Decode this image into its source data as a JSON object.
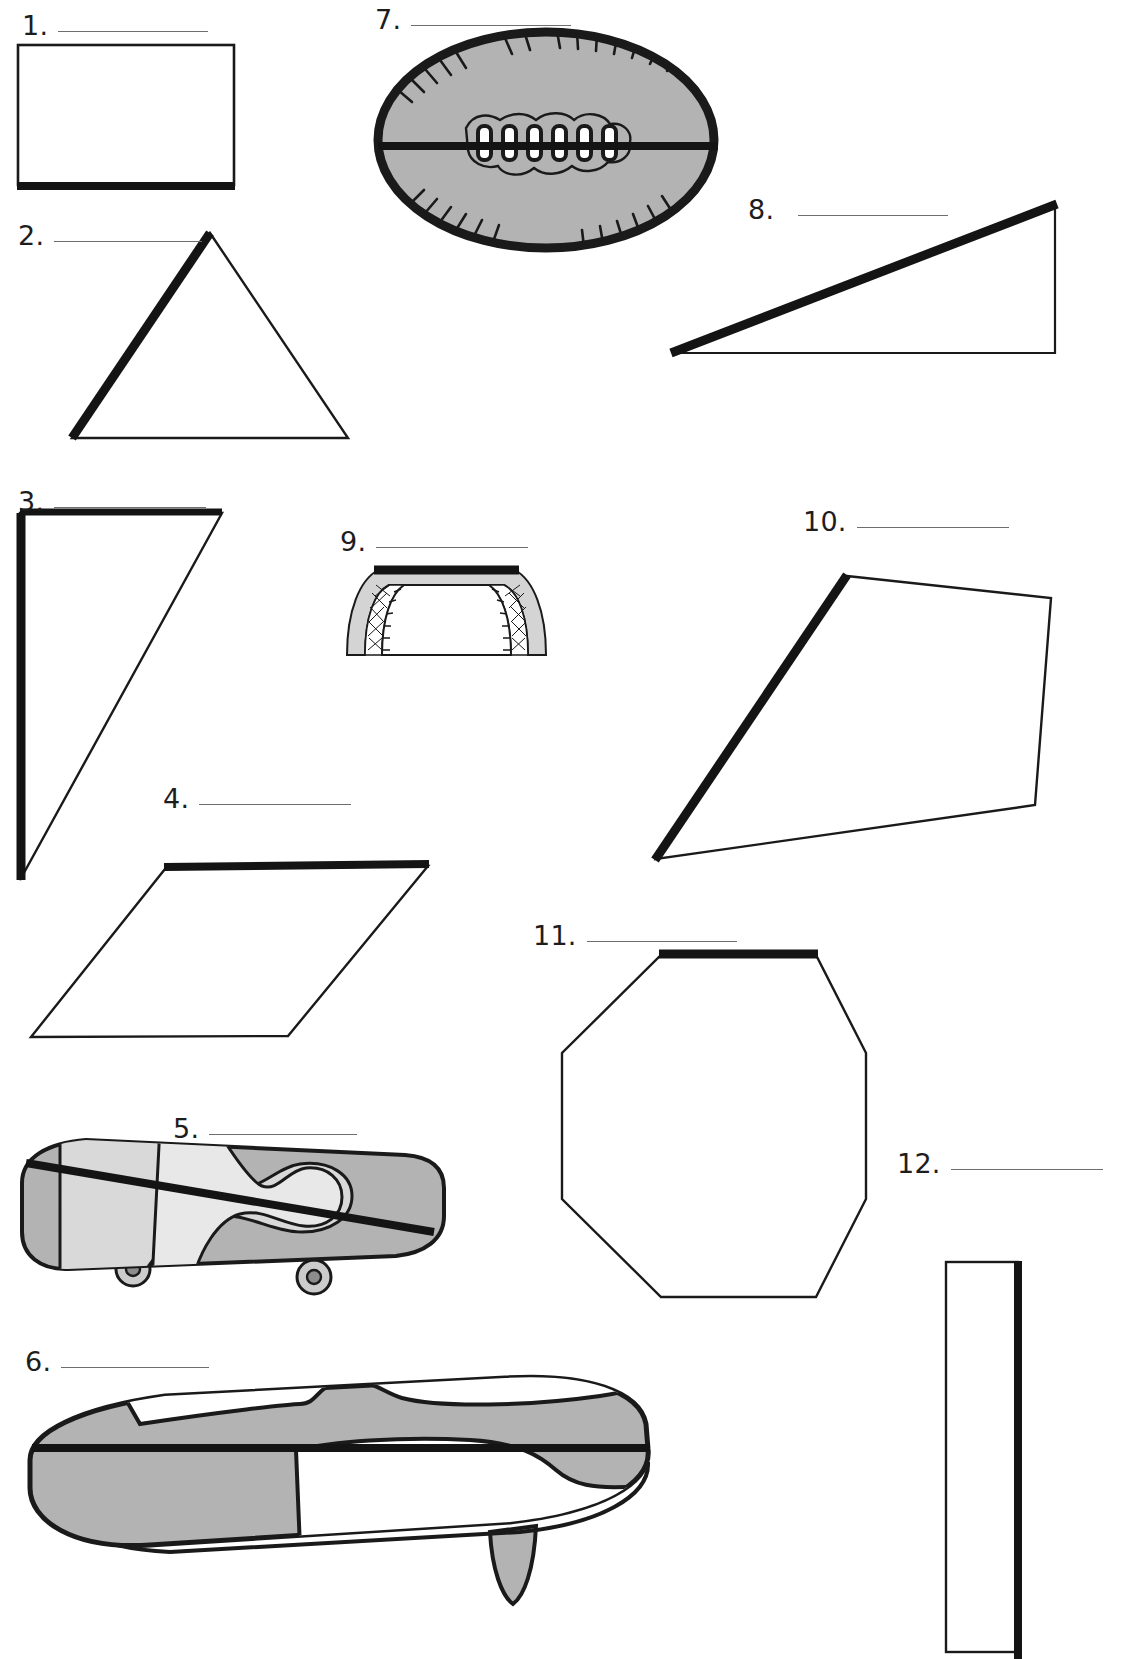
{
  "worksheet": {
    "page_background": "#ffffff",
    "ink_color": "#1a1a1a",
    "rule_color": "#6e6e6e",
    "fill_gray": "#b3b3b3",
    "fill_light_gray": "#d4d4d4",
    "items": [
      {
        "id": 1,
        "number": "1.",
        "figure": "rectangle",
        "highlighted_edge": "bottom",
        "label_x": 22,
        "label_y": 12,
        "rule_width": 150
      },
      {
        "id": 2,
        "number": "2.",
        "figure": "triangle",
        "highlighted_edge": "left-side",
        "label_x": 18,
        "label_y": 222,
        "rule_width": 148
      },
      {
        "id": 3,
        "number": "3.",
        "figure": "right-triangle",
        "highlighted_edge": "left-and-top",
        "label_x": 18,
        "label_y": 488,
        "rule_width": 152
      },
      {
        "id": 4,
        "number": "4.",
        "figure": "parallelogram",
        "highlighted_edge": "top",
        "label_x": 163,
        "label_y": 785,
        "rule_width": 152
      },
      {
        "id": 5,
        "number": "5.",
        "figure": "skateboard",
        "highlighted_edge": "diagonal-line",
        "label_x": 173,
        "label_y": 1115,
        "rule_width": 148
      },
      {
        "id": 6,
        "number": "6.",
        "figure": "surfboard",
        "highlighted_edge": "horizontal-line",
        "label_x": 25,
        "label_y": 1348,
        "rule_width": 148
      },
      {
        "id": 7,
        "number": "7.",
        "figure": "football",
        "highlighted_edge": "horizontal-line",
        "label_x": 375,
        "label_y": 6,
        "rule_width": 160
      },
      {
        "id": 8,
        "number": "8.",
        "figure": "right-triangle-wide",
        "highlighted_edge": "hypotenuse",
        "label_x": 748,
        "label_y": 196,
        "rule_width": 150
      },
      {
        "id": 9,
        "number": "9.",
        "figure": "soccer-goal",
        "highlighted_edge": "crossbar",
        "label_x": 340,
        "label_y": 528,
        "rule_width": 152
      },
      {
        "id": 10,
        "number": "10.",
        "figure": "quadrilateral",
        "highlighted_edge": "upper-left-side",
        "label_x": 803,
        "label_y": 508,
        "rule_width": 152
      },
      {
        "id": 11,
        "number": "11.",
        "figure": "octagon",
        "highlighted_edge": "top",
        "label_x": 533,
        "label_y": 922,
        "rule_width": 150
      },
      {
        "id": 12,
        "number": "12.",
        "figure": "narrow-rectangle",
        "highlighted_edge": "right",
        "label_x": 897,
        "label_y": 1150,
        "rule_width": 152
      }
    ]
  }
}
